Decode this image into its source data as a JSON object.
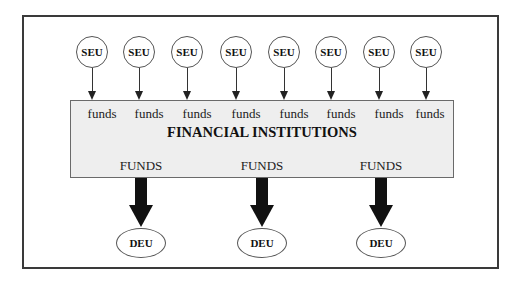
{
  "diagram": {
    "surplus_units": [
      {
        "label": "SEU",
        "flow": "funds"
      },
      {
        "label": "SEU",
        "flow": "funds"
      },
      {
        "label": "SEU",
        "flow": "funds"
      },
      {
        "label": "SEU",
        "flow": "funds"
      },
      {
        "label": "SEU",
        "flow": "funds"
      },
      {
        "label": "SEU",
        "flow": "funds"
      },
      {
        "label": "SEU",
        "flow": "funds"
      },
      {
        "label": "SEU",
        "flow": "funds"
      }
    ],
    "intermediary": {
      "title": "FINANCIAL INSTITUTIONS"
    },
    "deficit_units": [
      {
        "label": "DEU",
        "flow": "FUNDS"
      },
      {
        "label": "DEU",
        "flow": "FUNDS"
      },
      {
        "label": "DEU",
        "flow": "FUNDS"
      }
    ],
    "colors": {
      "box_fill": "#eeeeee",
      "frame": "#3a3a3a",
      "arrow": "#111111"
    }
  }
}
